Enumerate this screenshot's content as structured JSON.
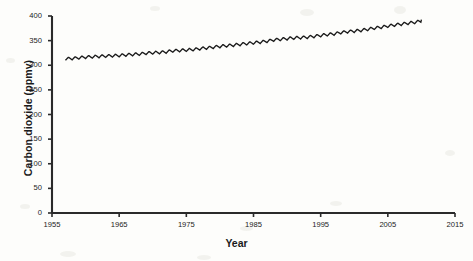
{
  "chart_data": {
    "type": "line",
    "title": "",
    "xlabel": "Year",
    "ylabel": "Carbon dioxide (ppmv)",
    "xlim": [
      1955,
      2015
    ],
    "ylim": [
      0,
      400
    ],
    "xticks": [
      1955,
      1965,
      1975,
      1985,
      1995,
      2005,
      2015
    ],
    "xtick_labels": [
      "1955",
      "1965",
      "1975",
      "1985",
      "1995",
      "2005",
      "2015"
    ],
    "yticks": [
      0,
      50,
      100,
      150,
      200,
      250,
      300,
      350,
      400
    ],
    "ytick_labels": [
      "0",
      "50",
      "100",
      "150",
      "200",
      "250",
      "300",
      "350",
      "400"
    ],
    "grid": false,
    "legend": null,
    "series": [
      {
        "name": "Atmospheric CO2 (Mauna Loa)",
        "color": "#1a1a1a",
        "seasonal_amplitude_ppmv": 3.0,
        "seasonal_period_years": 1,
        "x": [
          1957,
          1958,
          1959,
          1960,
          1961,
          1962,
          1963,
          1964,
          1965,
          1966,
          1967,
          1968,
          1969,
          1970,
          1971,
          1972,
          1973,
          1974,
          1975,
          1976,
          1977,
          1978,
          1979,
          1980,
          1981,
          1982,
          1983,
          1984,
          1985,
          1986,
          1987,
          1988,
          1989,
          1990,
          1991,
          1992,
          1993,
          1994,
          1995,
          1996,
          1997,
          1998,
          1999,
          2000,
          2001,
          2002,
          2003,
          2004,
          2005,
          2006,
          2007,
          2008,
          2009,
          2010
        ],
        "values": [
          313.0,
          314.0,
          315.3,
          316.6,
          317.3,
          318.2,
          318.8,
          319.4,
          320.0,
          321.2,
          322.0,
          322.9,
          324.5,
          325.5,
          326.1,
          327.3,
          329.5,
          330.1,
          331.0,
          332.0,
          333.7,
          335.3,
          336.7,
          338.5,
          339.8,
          341.0,
          342.6,
          344.2,
          345.7,
          347.1,
          348.9,
          351.5,
          352.8,
          354.2,
          355.5,
          356.3,
          357.0,
          358.8,
          360.7,
          362.5,
          363.7,
          366.6,
          368.3,
          369.5,
          371.0,
          373.1,
          375.6,
          377.4,
          379.7,
          381.8,
          383.7,
          385.5,
          387.3,
          389.8
        ]
      }
    ]
  },
  "axes": {
    "y_label": "Carbon dioxide (ppmv)",
    "x_label": "Year"
  }
}
